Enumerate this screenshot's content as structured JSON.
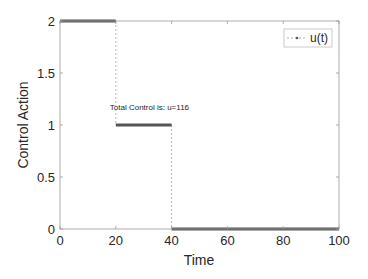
{
  "chart_data": {
    "type": "line",
    "title": "",
    "xlabel": "Time",
    "ylabel": "Control Action",
    "xlim": [
      0,
      100
    ],
    "ylim": [
      0,
      2
    ],
    "xticks": [
      0,
      20,
      40,
      60,
      80,
      100
    ],
    "yticks": [
      0,
      0.5,
      1,
      1.5,
      2
    ],
    "xtick_labels": [
      "0",
      "20",
      "40",
      "60",
      "80",
      "100"
    ],
    "ytick_labels": [
      "0",
      "0.5",
      "1",
      "1.5",
      "2"
    ],
    "grid": false,
    "legend": {
      "position": "upper right",
      "entries": [
        "u(t)"
      ]
    },
    "annotations": [
      {
        "text": "Total Control is: u=116",
        "x": 20,
        "y": 1.17
      }
    ],
    "series": [
      {
        "name": "u(t)",
        "style": "step",
        "color": "#555555",
        "segments": [
          {
            "x": [
              0,
              20
            ],
            "y": 2
          },
          {
            "x": [
              20,
              40
            ],
            "y": 1
          },
          {
            "x": [
              40,
              100
            ],
            "y": 0
          }
        ],
        "x": [
          0,
          20,
          20,
          40,
          40,
          100
        ],
        "y": [
          2,
          2,
          1,
          1,
          0,
          0
        ]
      }
    ]
  },
  "colors": {
    "axis": "#262626",
    "line": "#555555",
    "connector": "#999999",
    "background": "#ffffff"
  }
}
